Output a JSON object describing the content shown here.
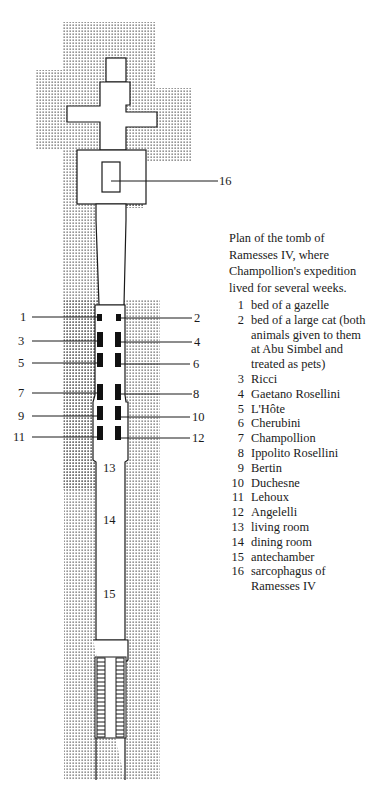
{
  "caption": "Plan of the tomb of Ramesses IV, where Champollion's expedition lived for several weeks.",
  "legend": [
    {
      "num": "1",
      "text": "bed of a gazelle"
    },
    {
      "num": "2",
      "text": "bed of a large cat (both animals given to them at Abu Simbel and treated as pets)"
    },
    {
      "num": "3",
      "text": "Ricci"
    },
    {
      "num": "4",
      "text": "Gaetano Rosellini"
    },
    {
      "num": "5",
      "text": "L'Hôte"
    },
    {
      "num": "6",
      "text": "Cherubini"
    },
    {
      "num": "7",
      "text": "Champollion"
    },
    {
      "num": "8",
      "text": "Ippolito Rosellini"
    },
    {
      "num": "9",
      "text": "Bertin"
    },
    {
      "num": "10",
      "text": "Duchesne"
    },
    {
      "num": "11",
      "text": "Lehoux"
    },
    {
      "num": "12",
      "text": "Angelelli"
    },
    {
      "num": "13",
      "text": "living room"
    },
    {
      "num": "14",
      "text": "dining room"
    },
    {
      "num": "15",
      "text": "antechamber"
    },
    {
      "num": "16",
      "text": "sarcophagus of Ramesses IV"
    }
  ],
  "plan_labels": {
    "left_beds": [
      "1",
      "3",
      "5",
      "7",
      "9",
      "11"
    ],
    "right_beds": [
      "2",
      "4",
      "6",
      "8",
      "10",
      "12"
    ],
    "rooms": [
      "13",
      "14",
      "15"
    ],
    "sarcophagus": "16"
  },
  "colors": {
    "ink": "#1a1a1a",
    "rock_dots": "#5a5a5a",
    "background": "#ffffff"
  }
}
